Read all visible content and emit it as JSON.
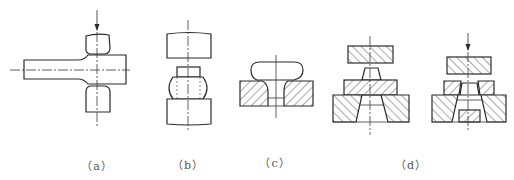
{
  "figure": {
    "panels": [
      {
        "id": "a",
        "label": "（a）",
        "description": "Upsetting the head of a bar between two dies, force applied from above"
      },
      {
        "id": "b",
        "label": "（b）",
        "description": "Upsetting a cylindrical billet between flat dies (barrelling)"
      },
      {
        "id": "c",
        "label": "（c）",
        "description": "Upset head formed on a part seated in a hatched die"
      },
      {
        "id": "d",
        "label": "（d）",
        "description": "Closed-die extrusion/forging sequence with punch, guide plate and die, shown before and during pressing"
      }
    ],
    "colors": {
      "line": "#2a2a2a",
      "caption": "#555555",
      "background": "#ffffff"
    }
  }
}
